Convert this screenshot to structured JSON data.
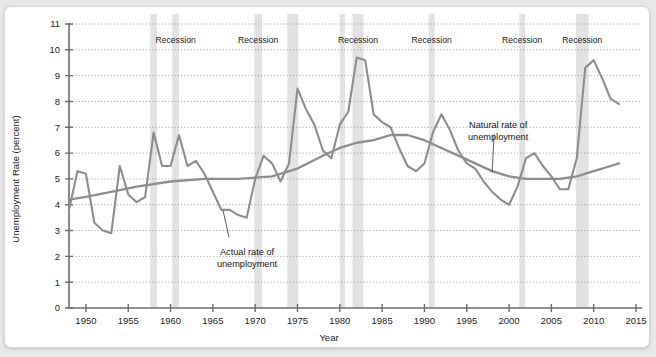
{
  "chart_data": {
    "type": "line",
    "title": "",
    "xlabel": "Year",
    "ylabel": "Unemployment Rate (percent)",
    "xlim": [
      1948,
      2015
    ],
    "ylim": [
      0,
      11
    ],
    "grid": true,
    "legend_position": "inline-annotations",
    "xticks": [
      1950,
      1955,
      1960,
      1965,
      1970,
      1975,
      1980,
      1985,
      1990,
      1995,
      2000,
      2005,
      2010,
      2015
    ],
    "yticks": [
      0,
      1,
      2,
      3,
      4,
      5,
      6,
      7,
      8,
      9,
      10,
      11
    ],
    "series": [
      {
        "name": "Actual rate of unemployment",
        "color": "#8d8d8d",
        "x": [
          1948,
          1949,
          1950,
          1951,
          1952,
          1953,
          1954,
          1955,
          1956,
          1957,
          1958,
          1959,
          1960,
          1961,
          1962,
          1963,
          1964,
          1965,
          1966,
          1967,
          1968,
          1969,
          1970,
          1971,
          1972,
          1973,
          1974,
          1975,
          1976,
          1977,
          1978,
          1979,
          1980,
          1981,
          1982,
          1983,
          1984,
          1985,
          1986,
          1987,
          1988,
          1989,
          1990,
          1991,
          1992,
          1993,
          1994,
          1995,
          1996,
          1997,
          1998,
          1999,
          2000,
          2001,
          2002,
          2003,
          2004,
          2005,
          2006,
          2007,
          2008,
          2009,
          2010,
          2011,
          2012,
          2013
        ],
        "values": [
          3.8,
          5.3,
          5.2,
          3.3,
          3.0,
          2.9,
          5.5,
          4.4,
          4.1,
          4.3,
          6.8,
          5.5,
          5.5,
          6.7,
          5.5,
          5.7,
          5.2,
          4.5,
          3.8,
          3.8,
          3.6,
          3.5,
          5.0,
          5.9,
          5.6,
          4.9,
          5.6,
          8.5,
          7.7,
          7.1,
          6.1,
          5.8,
          7.1,
          7.6,
          9.7,
          9.6,
          7.5,
          7.2,
          7.0,
          6.2,
          5.5,
          5.3,
          5.6,
          6.8,
          7.5,
          6.9,
          6.1,
          5.6,
          5.4,
          4.9,
          4.5,
          4.2,
          4.0,
          4.7,
          5.8,
          6.0,
          5.5,
          5.1,
          4.6,
          4.6,
          5.8,
          9.3,
          9.6,
          8.9,
          8.1,
          7.9
        ]
      },
      {
        "name": "Natural rate of unemployment",
        "color": "#8d8d8d",
        "x": [
          1948,
          1950,
          1953,
          1956,
          1960,
          1964,
          1968,
          1972,
          1975,
          1978,
          1980,
          1982,
          1984,
          1986,
          1988,
          1990,
          1992,
          1994,
          1996,
          1998,
          2000,
          2002,
          2004,
          2006,
          2008,
          2010,
          2012,
          2013
        ],
        "values": [
          4.2,
          4.3,
          4.5,
          4.7,
          4.9,
          5.0,
          5.0,
          5.1,
          5.4,
          5.9,
          6.2,
          6.4,
          6.5,
          6.7,
          6.7,
          6.5,
          6.2,
          5.9,
          5.6,
          5.3,
          5.1,
          5.0,
          5.0,
          5.0,
          5.1,
          5.3,
          5.5,
          5.6
        ]
      }
    ],
    "recession_bands": [
      {
        "label": "Recession",
        "start": 1957.6,
        "end": 1958.4,
        "labeled": false
      },
      {
        "label": "Recession",
        "start": 1960.2,
        "end": 1961.0,
        "labeled": true
      },
      {
        "label": "Recession",
        "start": 1969.9,
        "end": 1970.8,
        "labeled": true
      },
      {
        "label": "Recession",
        "start": 1973.8,
        "end": 1975.1,
        "labeled": false
      },
      {
        "label": "Recession",
        "start": 1980.0,
        "end": 1980.6,
        "labeled": false
      },
      {
        "label": "Recession",
        "start": 1981.5,
        "end": 1982.8,
        "labeled": true
      },
      {
        "label": "Recession",
        "start": 1990.5,
        "end": 1991.2,
        "labeled": true
      },
      {
        "label": "Recession",
        "start": 2001.2,
        "end": 2001.9,
        "labeled": true
      },
      {
        "label": "Recession",
        "start": 2007.9,
        "end": 2009.4,
        "labeled": true
      }
    ],
    "annotations": [
      {
        "text_line1": "Actual rate of",
        "text_line2": "unemployment",
        "point_x": 1966.2,
        "point_y": 3.9
      },
      {
        "text_line1": "Natural rate of",
        "text_line2": "unemployment",
        "point_x": 1998.0,
        "point_y": 5.1
      }
    ]
  },
  "labels": {
    "y_axis_title": "Unemployment Rate (percent)",
    "x_axis_title": "Year",
    "recession": "Recession",
    "annotation_actual_line1": "Actual rate of",
    "annotation_actual_line2": "unemployment",
    "annotation_natural_line1": "Natural rate of",
    "annotation_natural_line2": "unemployment"
  },
  "ytick_labels": [
    "0",
    "1",
    "2",
    "3",
    "4",
    "5",
    "6",
    "7",
    "8",
    "9",
    "10",
    "11"
  ],
  "xtick_labels": [
    "1950",
    "1955",
    "1960",
    "1965",
    "1970",
    "1975",
    "1980",
    "1985",
    "1990",
    "1995",
    "2000",
    "2005",
    "2010",
    "2015"
  ],
  "colors": {
    "line": "#8d8d8d",
    "band": "#e2e2e2",
    "axis": "#6d6d6d",
    "grid": "#9a9a9a",
    "background": "#ffffff",
    "page": "#e8e8e8"
  }
}
